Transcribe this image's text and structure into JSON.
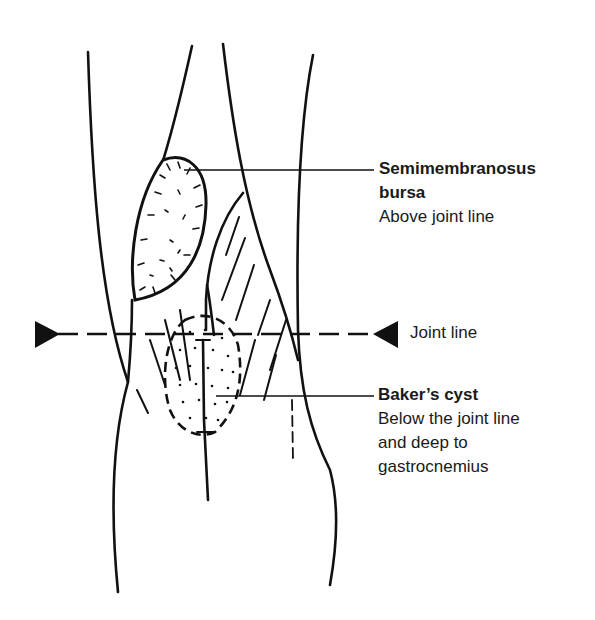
{
  "diagram": {
    "colors": {
      "ink": "#111111",
      "background": "#ffffff"
    },
    "labels": {
      "semimembranosus": {
        "title_line1": "Semimembranosus",
        "title_line2": "bursa",
        "description": "Above joint line"
      },
      "joint_line": {
        "text": "Joint line"
      },
      "bakers_cyst": {
        "title": "Baker’s cyst",
        "description_line1": "Below the joint line",
        "description_line2": "and deep to",
        "description_line3": "gastrocnemius"
      }
    },
    "markers": {
      "joint_line_left_arrow": "right-pointing-triangle",
      "joint_line_right_arrow": "left-pointing-triangle"
    }
  }
}
